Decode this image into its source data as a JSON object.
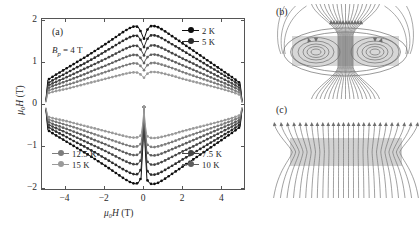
{
  "figure": {
    "panels": [
      {
        "tag": "(a)",
        "kind": "plot"
      },
      {
        "tag": "(b)",
        "kind": "field-diagram-perpendicular"
      },
      {
        "tag": "(c)",
        "kind": "field-diagram-parallel"
      }
    ]
  },
  "panel_a": {
    "tag": "(a)",
    "annotation": "Bₚ = 4 T",
    "annotation_symbol": "B",
    "annotation_sub": "p",
    "annotation_rest": "= 4 T",
    "x_axis_label_sym": "μ₀H",
    "x_axis_label_unit": "(T)",
    "y_axis_label_sym": "μ₀H",
    "y_axis_label_unit": "(T)",
    "legend_top_right": [
      {
        "label": "2 K",
        "color": "#0d0d0d"
      },
      {
        "label": "5 K",
        "color": "#2a2a2a"
      }
    ],
    "legend_bottom_right": [
      {
        "label": "7.5 K",
        "color": "#444444"
      },
      {
        "label": "10 K",
        "color": "#5e5e5e"
      }
    ],
    "legend_bottom_left": [
      {
        "label": "12.5 K",
        "color": "#7d7d7d"
      },
      {
        "label": "15 K",
        "color": "#9a9a9a"
      }
    ]
  },
  "panel_b": {
    "tag": "(b)"
  },
  "panel_c": {
    "tag": "(c)"
  },
  "colors": {
    "axis": "#555555",
    "text": "#2b2b2b",
    "slab_fill": "#b7b7b7",
    "field_line": "#6e6e6e",
    "background": "#ffffff"
  },
  "chart_data": {
    "type": "line",
    "title": "",
    "xlabel": "μ₀H (T)",
    "ylabel": "μ₀H (T)",
    "xlim": [
      -5.2,
      5.2
    ],
    "ylim": [
      -2.05,
      2.05
    ],
    "xticks": [
      -4,
      -2,
      0,
      2,
      4
    ],
    "yticks": [
      -2,
      -1,
      0,
      1,
      2
    ],
    "grid": false,
    "legend_position": "corners",
    "annotations": [
      {
        "text": "Bₚ = 4 T",
        "x": -4.3,
        "y": 1.47
      }
    ],
    "series": [
      {
        "name": "2 K",
        "color": "#0d0d0d",
        "branch_upper_x": [
          -5.0,
          -4.9,
          -4.5,
          -4.0,
          -3.5,
          -3.0,
          -2.5,
          -2.0,
          -1.5,
          -1.0,
          -0.7,
          -0.45,
          -0.3,
          -0.15,
          -0.05,
          0.0,
          0.05,
          0.15,
          0.3,
          0.45,
          0.7,
          1.0,
          1.5,
          2.0,
          2.5,
          3.0,
          3.5,
          4.0,
          4.5,
          4.9,
          5.0
        ],
        "branch_upper_y": [
          0.12,
          0.6,
          0.72,
          0.86,
          1.0,
          1.14,
          1.29,
          1.44,
          1.6,
          1.76,
          1.84,
          1.88,
          1.86,
          1.74,
          1.62,
          1.58,
          1.64,
          1.78,
          1.87,
          1.89,
          1.86,
          1.78,
          1.62,
          1.46,
          1.3,
          1.14,
          0.98,
          0.82,
          0.66,
          0.52,
          0.1
        ],
        "branch_lower_x": [
          -5.0,
          -4.9,
          -4.5,
          -4.0,
          -3.5,
          -3.0,
          -2.5,
          -2.0,
          -1.5,
          -1.0,
          -0.7,
          -0.45,
          -0.3,
          -0.15,
          -0.05,
          0.0,
          0.05,
          0.15,
          0.3,
          0.45,
          0.7,
          1.0,
          1.5,
          2.0,
          2.5,
          3.0,
          3.5,
          4.0,
          4.5,
          4.9,
          5.0
        ],
        "branch_lower_y": [
          -0.12,
          -0.6,
          -0.72,
          -0.86,
          -1.0,
          -1.14,
          -1.29,
          -1.44,
          -1.6,
          -1.76,
          -1.84,
          -1.88,
          -1.86,
          -1.74,
          -0.9,
          -0.05,
          -0.92,
          -1.78,
          -1.87,
          -1.89,
          -1.86,
          -1.78,
          -1.62,
          -1.46,
          -1.3,
          -1.14,
          -0.98,
          -0.82,
          -0.66,
          -0.52,
          -0.1
        ]
      },
      {
        "name": "5 K",
        "color": "#2a2a2a",
        "branch_upper_x": [
          -5.0,
          -4.9,
          -4.5,
          -4.0,
          -3.5,
          -3.0,
          -2.5,
          -2.0,
          -1.5,
          -1.0,
          -0.7,
          -0.45,
          -0.3,
          -0.15,
          -0.05,
          0.0,
          0.05,
          0.15,
          0.3,
          0.45,
          0.7,
          1.0,
          1.5,
          2.0,
          2.5,
          3.0,
          3.5,
          4.0,
          4.5,
          4.9,
          5.0
        ],
        "branch_upper_y": [
          0.1,
          0.52,
          0.63,
          0.75,
          0.88,
          1.0,
          1.13,
          1.27,
          1.41,
          1.55,
          1.62,
          1.66,
          1.64,
          1.53,
          1.42,
          1.38,
          1.44,
          1.56,
          1.65,
          1.67,
          1.64,
          1.57,
          1.43,
          1.29,
          1.15,
          1.01,
          0.87,
          0.73,
          0.59,
          0.46,
          0.09
        ],
        "branch_lower_x": [
          -5.0,
          -4.9,
          -4.5,
          -4.0,
          -3.5,
          -3.0,
          -2.5,
          -2.0,
          -1.5,
          -1.0,
          -0.7,
          -0.45,
          -0.3,
          -0.15,
          -0.05,
          0.0,
          0.05,
          0.15,
          0.3,
          0.45,
          0.7,
          1.0,
          1.5,
          2.0,
          2.5,
          3.0,
          3.5,
          4.0,
          4.5,
          4.9,
          5.0
        ],
        "branch_lower_y": [
          -0.1,
          -0.52,
          -0.63,
          -0.75,
          -0.88,
          -1.0,
          -1.13,
          -1.27,
          -1.41,
          -1.55,
          -1.62,
          -1.66,
          -1.64,
          -1.53,
          -0.8,
          -0.05,
          -0.82,
          -1.56,
          -1.65,
          -1.67,
          -1.64,
          -1.57,
          -1.43,
          -1.29,
          -1.15,
          -1.01,
          -0.87,
          -0.73,
          -0.59,
          -0.46,
          -0.09
        ]
      },
      {
        "name": "7.5 K",
        "color": "#444444",
        "branch_upper_x": [
          -5.0,
          -4.9,
          -4.5,
          -4.0,
          -3.5,
          -3.0,
          -2.5,
          -2.0,
          -1.5,
          -1.0,
          -0.7,
          -0.45,
          -0.3,
          -0.15,
          -0.05,
          0.0,
          0.05,
          0.15,
          0.3,
          0.45,
          0.7,
          1.0,
          1.5,
          2.0,
          2.5,
          3.0,
          3.5,
          4.0,
          4.5,
          4.9,
          5.0
        ],
        "branch_upper_y": [
          0.09,
          0.46,
          0.55,
          0.65,
          0.76,
          0.87,
          0.98,
          1.09,
          1.21,
          1.33,
          1.39,
          1.42,
          1.4,
          1.31,
          1.22,
          1.18,
          1.24,
          1.34,
          1.41,
          1.43,
          1.4,
          1.34,
          1.22,
          1.1,
          0.99,
          0.87,
          0.75,
          0.63,
          0.51,
          0.4,
          0.08
        ],
        "branch_lower_x": [
          -5.0,
          -4.9,
          -4.5,
          -4.0,
          -3.5,
          -3.0,
          -2.5,
          -2.0,
          -1.5,
          -1.0,
          -0.7,
          -0.45,
          -0.3,
          -0.15,
          -0.05,
          0.0,
          0.05,
          0.15,
          0.3,
          0.45,
          0.7,
          1.0,
          1.5,
          2.0,
          2.5,
          3.0,
          3.5,
          4.0,
          4.5,
          4.9,
          5.0
        ],
        "branch_lower_y": [
          -0.09,
          -0.46,
          -0.55,
          -0.65,
          -0.76,
          -0.87,
          -0.98,
          -1.09,
          -1.21,
          -1.33,
          -1.39,
          -1.42,
          -1.4,
          -1.31,
          -0.7,
          -0.05,
          -0.72,
          -1.34,
          -1.41,
          -1.43,
          -1.4,
          -1.34,
          -1.22,
          -1.1,
          -0.99,
          -0.87,
          -0.75,
          -0.63,
          -0.51,
          -0.4,
          -0.08
        ]
      },
      {
        "name": "10 K",
        "color": "#5e5e5e",
        "branch_upper_x": [
          -5.0,
          -4.9,
          -4.5,
          -4.0,
          -3.5,
          -3.0,
          -2.5,
          -2.0,
          -1.5,
          -1.0,
          -0.7,
          -0.45,
          -0.3,
          -0.15,
          -0.05,
          0.0,
          0.05,
          0.15,
          0.3,
          0.45,
          0.7,
          1.0,
          1.5,
          2.0,
          2.5,
          3.0,
          3.5,
          4.0,
          4.5,
          4.9,
          5.0
        ],
        "branch_upper_y": [
          0.08,
          0.4,
          0.48,
          0.56,
          0.65,
          0.74,
          0.84,
          0.93,
          1.03,
          1.13,
          1.18,
          1.2,
          1.18,
          1.11,
          1.03,
          1.0,
          1.05,
          1.13,
          1.19,
          1.21,
          1.19,
          1.14,
          1.04,
          0.94,
          0.84,
          0.74,
          0.64,
          0.54,
          0.44,
          0.35,
          0.07
        ],
        "branch_lower_x": [
          -5.0,
          -4.9,
          -4.5,
          -4.0,
          -3.5,
          -3.0,
          -2.5,
          -2.0,
          -1.5,
          -1.0,
          -0.7,
          -0.45,
          -0.3,
          -0.15,
          -0.05,
          0.0,
          0.05,
          0.15,
          0.3,
          0.45,
          0.7,
          1.0,
          1.5,
          2.0,
          2.5,
          3.0,
          3.5,
          4.0,
          4.5,
          4.9,
          5.0
        ],
        "branch_lower_y": [
          -0.08,
          -0.4,
          -0.48,
          -0.56,
          -0.65,
          -0.74,
          -0.84,
          -0.93,
          -1.03,
          -1.13,
          -1.18,
          -1.2,
          -1.18,
          -1.11,
          -0.6,
          -0.05,
          -0.62,
          -1.13,
          -1.19,
          -1.21,
          -1.19,
          -1.14,
          -1.04,
          -0.94,
          -0.84,
          -0.74,
          -0.64,
          -0.54,
          -0.44,
          -0.35,
          -0.07
        ]
      },
      {
        "name": "12.5 K",
        "color": "#7d7d7d",
        "branch_upper_x": [
          -5.0,
          -4.9,
          -4.5,
          -4.0,
          -3.5,
          -3.0,
          -2.5,
          -2.0,
          -1.5,
          -1.0,
          -0.7,
          -0.45,
          -0.3,
          -0.15,
          -0.05,
          0.0,
          0.05,
          0.15,
          0.3,
          0.45,
          0.7,
          1.0,
          1.5,
          2.0,
          2.5,
          3.0,
          3.5,
          4.0,
          4.5,
          4.9,
          5.0
        ],
        "branch_upper_y": [
          0.07,
          0.34,
          0.4,
          0.47,
          0.54,
          0.62,
          0.7,
          0.78,
          0.86,
          0.94,
          0.98,
          1.0,
          0.98,
          0.92,
          0.86,
          0.83,
          0.87,
          0.94,
          0.99,
          1.01,
          0.99,
          0.95,
          0.87,
          0.78,
          0.7,
          0.62,
          0.54,
          0.46,
          0.37,
          0.29,
          0.06
        ],
        "branch_lower_x": [
          -5.0,
          -4.9,
          -4.5,
          -4.0,
          -3.5,
          -3.0,
          -2.5,
          -2.0,
          -1.5,
          -1.0,
          -0.7,
          -0.45,
          -0.3,
          -0.15,
          -0.05,
          0.0,
          0.05,
          0.15,
          0.3,
          0.45,
          0.7,
          1.0,
          1.5,
          2.0,
          2.5,
          3.0,
          3.5,
          4.0,
          4.5,
          4.9,
          5.0
        ],
        "branch_lower_y": [
          -0.07,
          -0.34,
          -0.4,
          -0.47,
          -0.54,
          -0.62,
          -0.7,
          -0.78,
          -0.86,
          -0.94,
          -0.98,
          -1.0,
          -0.98,
          -0.92,
          -0.5,
          -0.05,
          -0.52,
          -0.94,
          -0.99,
          -1.01,
          -0.99,
          -0.95,
          -0.87,
          -0.78,
          -0.7,
          -0.62,
          -0.54,
          -0.46,
          -0.37,
          -0.29,
          -0.06
        ]
      },
      {
        "name": "15 K",
        "color": "#9a9a9a",
        "branch_upper_x": [
          -5.0,
          -4.9,
          -4.5,
          -4.0,
          -3.5,
          -3.0,
          -2.5,
          -2.0,
          -1.5,
          -1.0,
          -0.7,
          -0.45,
          -0.3,
          -0.15,
          -0.05,
          0.0,
          0.05,
          0.15,
          0.3,
          0.45,
          0.7,
          1.0,
          1.5,
          2.0,
          2.5,
          3.0,
          3.5,
          4.0,
          4.5,
          4.9,
          5.0
        ],
        "branch_upper_y": [
          0.06,
          0.28,
          0.33,
          0.38,
          0.44,
          0.5,
          0.56,
          0.62,
          0.68,
          0.74,
          0.77,
          0.78,
          0.77,
          0.72,
          0.67,
          0.65,
          0.68,
          0.74,
          0.78,
          0.79,
          0.78,
          0.75,
          0.69,
          0.62,
          0.56,
          0.5,
          0.44,
          0.38,
          0.31,
          0.24,
          0.05
        ],
        "branch_lower_x": [
          -5.0,
          -4.9,
          -4.5,
          -4.0,
          -3.5,
          -3.0,
          -2.5,
          -2.0,
          -1.5,
          -1.0,
          -0.7,
          -0.45,
          -0.3,
          -0.15,
          -0.05,
          0.0,
          0.05,
          0.15,
          0.3,
          0.45,
          0.7,
          1.0,
          1.5,
          2.0,
          2.5,
          3.0,
          3.5,
          4.0,
          4.5,
          4.9,
          5.0
        ],
        "branch_lower_y": [
          -0.06,
          -0.28,
          -0.33,
          -0.38,
          -0.44,
          -0.5,
          -0.56,
          -0.62,
          -0.68,
          -0.74,
          -0.77,
          -0.78,
          -0.77,
          -0.72,
          -0.4,
          -0.05,
          -0.42,
          -0.74,
          -0.78,
          -0.79,
          -0.78,
          -0.75,
          -0.69,
          -0.62,
          -0.56,
          -0.5,
          -0.44,
          -0.38,
          -0.31,
          -0.24,
          -0.05
        ]
      }
    ]
  }
}
